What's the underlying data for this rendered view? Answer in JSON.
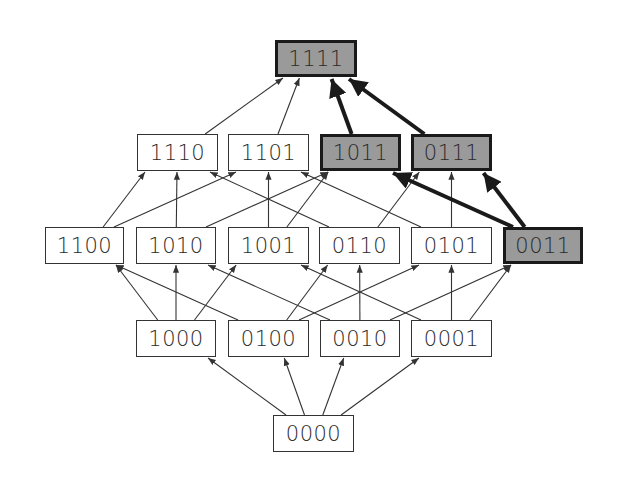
{
  "colors": {
    "highlight_fill": "#9a9a9a",
    "highlight_border": "#1a1a1a",
    "node_fill": "#ffffff",
    "edge": "#333333"
  },
  "nodes": [
    {
      "id": "1111",
      "label": "1111",
      "x": 275,
      "y": 40,
      "w": 82,
      "h": 37,
      "highlight": true
    },
    {
      "id": "1110",
      "label": "1110",
      "x": 137,
      "y": 134,
      "w": 81,
      "h": 37,
      "highlight": false
    },
    {
      "id": "1101",
      "label": "1101",
      "x": 228,
      "y": 134,
      "w": 81,
      "h": 37,
      "highlight": false
    },
    {
      "id": "1011",
      "label": "1011",
      "x": 320,
      "y": 134,
      "w": 81,
      "h": 37,
      "highlight": true
    },
    {
      "id": "0111",
      "label": "0111",
      "x": 411,
      "y": 134,
      "w": 81,
      "h": 37,
      "highlight": true
    },
    {
      "id": "1100",
      "label": "1100",
      "x": 45,
      "y": 227,
      "w": 79,
      "h": 37,
      "highlight": false
    },
    {
      "id": "1010",
      "label": "1010",
      "x": 136,
      "y": 227,
      "w": 80,
      "h": 37,
      "highlight": false
    },
    {
      "id": "1001",
      "label": "1001",
      "x": 228,
      "y": 227,
      "w": 81,
      "h": 37,
      "highlight": false
    },
    {
      "id": "0110",
      "label": "0110",
      "x": 319,
      "y": 227,
      "w": 81,
      "h": 37,
      "highlight": false
    },
    {
      "id": "0101",
      "label": "0101",
      "x": 411,
      "y": 227,
      "w": 81,
      "h": 37,
      "highlight": false
    },
    {
      "id": "0011",
      "label": "0011",
      "x": 503,
      "y": 227,
      "w": 80,
      "h": 37,
      "highlight": true
    },
    {
      "id": "1000",
      "label": "1000",
      "x": 136,
      "y": 320,
      "w": 80,
      "h": 37,
      "highlight": false
    },
    {
      "id": "0100",
      "label": "0100",
      "x": 228,
      "y": 320,
      "w": 81,
      "h": 37,
      "highlight": false
    },
    {
      "id": "0010",
      "label": "0010",
      "x": 320,
      "y": 320,
      "w": 80,
      "h": 37,
      "highlight": false
    },
    {
      "id": "0001",
      "label": "0001",
      "x": 411,
      "y": 320,
      "w": 81,
      "h": 37,
      "highlight": false
    },
    {
      "id": "0000",
      "label": "0000",
      "x": 273,
      "y": 415,
      "w": 81,
      "h": 37,
      "highlight": false
    }
  ],
  "edges": [
    {
      "from": "0000",
      "to": "1000"
    },
    {
      "from": "0000",
      "to": "0100"
    },
    {
      "from": "0000",
      "to": "0010"
    },
    {
      "from": "0000",
      "to": "0001"
    },
    {
      "from": "1000",
      "to": "1100"
    },
    {
      "from": "1000",
      "to": "1010"
    },
    {
      "from": "1000",
      "to": "1001"
    },
    {
      "from": "0100",
      "to": "1100"
    },
    {
      "from": "0100",
      "to": "0110"
    },
    {
      "from": "0100",
      "to": "0101"
    },
    {
      "from": "0010",
      "to": "1010"
    },
    {
      "from": "0010",
      "to": "0110"
    },
    {
      "from": "0010",
      "to": "0011"
    },
    {
      "from": "0001",
      "to": "1001"
    },
    {
      "from": "0001",
      "to": "0101"
    },
    {
      "from": "0001",
      "to": "0011"
    },
    {
      "from": "1100",
      "to": "1110"
    },
    {
      "from": "1100",
      "to": "1101"
    },
    {
      "from": "1010",
      "to": "1110"
    },
    {
      "from": "1010",
      "to": "1011"
    },
    {
      "from": "1001",
      "to": "1101"
    },
    {
      "from": "1001",
      "to": "1011"
    },
    {
      "from": "0110",
      "to": "1110"
    },
    {
      "from": "0110",
      "to": "0111"
    },
    {
      "from": "0101",
      "to": "1101"
    },
    {
      "from": "0101",
      "to": "0111"
    },
    {
      "from": "0011",
      "to": "1011",
      "highlight": true
    },
    {
      "from": "0011",
      "to": "0111",
      "highlight": true
    },
    {
      "from": "1110",
      "to": "1111"
    },
    {
      "from": "1101",
      "to": "1111"
    },
    {
      "from": "1011",
      "to": "1111",
      "highlight": true
    },
    {
      "from": "0111",
      "to": "1111",
      "highlight": true
    }
  ]
}
